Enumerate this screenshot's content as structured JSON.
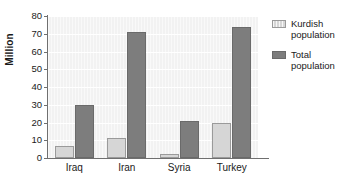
{
  "chart_data": {
    "type": "bar",
    "title": "",
    "subtitle": "",
    "xlabel": "",
    "ylabel": "Million",
    "categories": [
      "Iraq",
      "Iran",
      "Syria",
      "Turkey"
    ],
    "series": [
      {
        "name": "Kurdish population",
        "values": [
          7,
          11,
          2,
          20
        ],
        "color": "#d6d6d6"
      },
      {
        "name": "Total population",
        "values": [
          30,
          71,
          21,
          74
        ],
        "color": "#7d7d7d"
      }
    ],
    "ylim": [
      0,
      80
    ],
    "y_ticks": [
      0,
      10,
      20,
      30,
      40,
      50,
      60,
      70,
      80
    ],
    "y_tick_labels": [
      "0",
      "10",
      "20",
      "30",
      "40",
      "50",
      "60",
      "70",
      "80"
    ],
    "grid": true,
    "grid_axis": "y",
    "legend_position": "right",
    "legend": [
      "Kurdish population",
      "Total population"
    ],
    "plot_background": "#f2f2f2",
    "axis_color": "#6f6f6f"
  }
}
